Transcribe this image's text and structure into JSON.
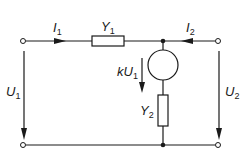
{
  "diagram": {
    "type": "circuit-two-port",
    "labels": {
      "I1": {
        "main": "I",
        "sub": "1"
      },
      "Y1": {
        "main": "Y",
        "sub": "1"
      },
      "I2": {
        "main": "I",
        "sub": "2"
      },
      "kU1": {
        "main": "kU",
        "sub": "1"
      },
      "Y2": {
        "main": "Y",
        "sub": "2"
      },
      "U1": {
        "main": "U",
        "sub": "1"
      },
      "U2": {
        "main": "U",
        "sub": "2"
      }
    },
    "components": [
      {
        "id": "Y1",
        "kind": "admittance",
        "orientation": "horizontal"
      },
      {
        "id": "source",
        "kind": "controlled-current-source",
        "value": "kU1"
      },
      {
        "id": "Y2",
        "kind": "admittance",
        "orientation": "vertical"
      }
    ],
    "colors": {
      "line": "#1a1a1a",
      "background": "#ffffff"
    }
  }
}
